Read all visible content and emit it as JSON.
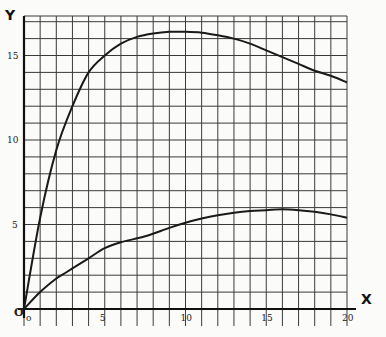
{
  "chart_data": {
    "type": "line",
    "title": "",
    "xlabel": "X",
    "ylabel": "Y",
    "origin_label": "O",
    "xlim": [
      0,
      20
    ],
    "ylim": [
      0,
      17
    ],
    "grid": true,
    "x_ticks": [
      0,
      5,
      10,
      15,
      20
    ],
    "x_tick_labels": [
      "o",
      "5",
      "10",
      "15",
      "20"
    ],
    "y_ticks": [
      5,
      10,
      15
    ],
    "y_tick_labels": [
      "5",
      "10",
      "15"
    ],
    "series": [
      {
        "name": "upper curve",
        "x": [
          0,
          1,
          2,
          3,
          4,
          5,
          6,
          7,
          8,
          9,
          10,
          11,
          12,
          13,
          14,
          15,
          16,
          17,
          18,
          19,
          20
        ],
        "y": [
          0,
          5.4,
          9.4,
          12.0,
          14.0,
          15.0,
          15.7,
          16.1,
          16.3,
          16.4,
          16.4,
          16.35,
          16.2,
          16.0,
          15.7,
          15.3,
          14.9,
          14.5,
          14.1,
          13.8,
          13.4
        ]
      },
      {
        "name": "lower curve",
        "x": [
          0,
          1,
          2,
          2.5,
          3,
          4,
          5,
          6,
          7.5,
          9,
          10,
          11,
          12,
          13,
          14,
          15,
          16,
          17,
          18,
          19,
          20
        ],
        "y": [
          0,
          1.0,
          1.8,
          2.1,
          2.4,
          3.0,
          3.6,
          3.95,
          4.3,
          4.8,
          5.1,
          5.35,
          5.55,
          5.7,
          5.8,
          5.85,
          5.9,
          5.85,
          5.75,
          5.6,
          5.4
        ]
      }
    ]
  }
}
